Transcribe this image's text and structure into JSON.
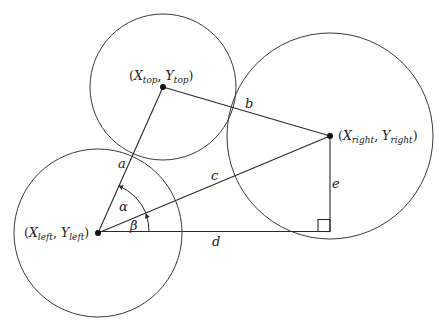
{
  "diagram": {
    "type": "geometry",
    "circles": [
      {
        "id": "top",
        "cx": 163,
        "cy": 87,
        "r": 73
      },
      {
        "id": "left",
        "cx": 98,
        "cy": 233,
        "r": 84
      },
      {
        "id": "right",
        "cx": 330,
        "cy": 136,
        "r": 103
      }
    ],
    "points": {
      "top": {
        "x": 163,
        "y": 87,
        "label_x": "X",
        "label_x_sub": "top",
        "label_y": "Y",
        "label_y_sub": "top"
      },
      "left": {
        "x": 98,
        "y": 233,
        "label_x": "X",
        "label_x_sub": "left",
        "label_y": "Y",
        "label_y_sub": "left"
      },
      "right": {
        "x": 330,
        "y": 136,
        "label_x": "X",
        "label_x_sub": "right",
        "label_y": "Y",
        "label_y_sub": "right"
      }
    },
    "segments": {
      "a": {
        "label": "a",
        "from": "left",
        "to": "top"
      },
      "b": {
        "label": "b",
        "from": "top",
        "to": "right"
      },
      "c": {
        "label": "c",
        "from": "left",
        "to": "right"
      },
      "d": {
        "label": "d",
        "from": "left",
        "to": "corner"
      },
      "e": {
        "label": "e",
        "from": "right",
        "to": "corner"
      }
    },
    "angles": {
      "alpha": {
        "label": "α",
        "between": [
          "c",
          "a"
        ]
      },
      "beta": {
        "label": "β",
        "between": [
          "d",
          "c"
        ]
      }
    },
    "right_angle_marker": {
      "at": "corner",
      "x": 330,
      "y": 231
    },
    "punct": {
      "open": "(",
      "comma": ", ",
      "close": ")"
    }
  }
}
